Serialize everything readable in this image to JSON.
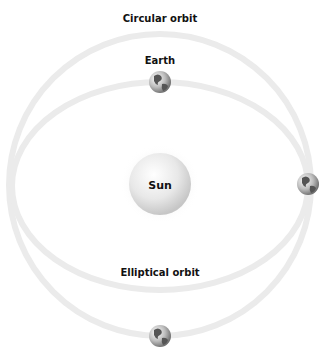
{
  "diagram": {
    "labels": {
      "circular_orbit": "Circular orbit",
      "elliptical_orbit": "Elliptical orbit",
      "earth": "Earth",
      "sun": "Sun"
    },
    "colors": {
      "orbit": "#ebebeb",
      "sun_light": "#ffffff",
      "sun_dark": "#c8c8c8",
      "earth_dark": "#555555"
    }
  }
}
